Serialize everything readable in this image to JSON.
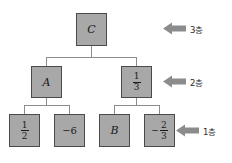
{
  "diagram": {
    "type": "binary-tree",
    "title": "",
    "colors": {
      "node_fill": "#a8a8a8",
      "node_border": "#4a4a4a",
      "connector": "#8c8c8c",
      "arrow": "#8c8c8c",
      "background": "#ffffff",
      "text": "#1a1a1a"
    },
    "levels": [
      {
        "id": "level-3",
        "label": "3층",
        "arrow": "left-arrow-icon"
      },
      {
        "id": "level-2",
        "label": "2층",
        "arrow": "left-arrow-icon"
      },
      {
        "id": "level-1",
        "label": "1층",
        "arrow": "left-arrow-icon"
      }
    ],
    "nodes": {
      "root": {
        "id": "node-c",
        "text": "C",
        "style": "italic",
        "level": 3
      },
      "level2": [
        {
          "id": "node-a",
          "text": "A",
          "style": "italic",
          "level": 2
        },
        {
          "id": "node-one-third",
          "text": "1/3",
          "style": "fraction",
          "sign": "",
          "numerator": "1",
          "denominator": "3",
          "level": 2
        }
      ],
      "level1": [
        {
          "id": "node-one-half",
          "text": "1/2",
          "style": "fraction",
          "sign": "",
          "numerator": "1",
          "denominator": "2",
          "level": 1
        },
        {
          "id": "node-minus-six",
          "text": "−6",
          "style": "plain",
          "level": 1
        },
        {
          "id": "node-b",
          "text": "B",
          "style": "italic",
          "level": 1
        },
        {
          "id": "node-minus-two-thirds",
          "text": "-2/3",
          "style": "fraction",
          "sign": "−",
          "numerator": "2",
          "denominator": "3",
          "level": 1
        }
      ]
    },
    "edges": [
      {
        "from": "node-c",
        "to": "node-a"
      },
      {
        "from": "node-c",
        "to": "node-one-third"
      },
      {
        "from": "node-a",
        "to": "node-one-half"
      },
      {
        "from": "node-a",
        "to": "node-minus-six"
      },
      {
        "from": "node-one-third",
        "to": "node-b"
      },
      {
        "from": "node-one-third",
        "to": "node-minus-two-thirds"
      }
    ]
  }
}
